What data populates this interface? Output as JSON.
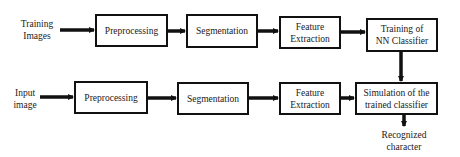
{
  "diagram": {
    "type": "flowchart",
    "colors": {
      "stroke": "#111111",
      "background": "#ffffff",
      "text": "#1a1a1a"
    },
    "training_row": {
      "input_label": "Training Images",
      "input_label_lines": [
        "Training",
        "Images"
      ],
      "steps": [
        {
          "id": "train-preprocessing",
          "lines": [
            "Preprocessing"
          ]
        },
        {
          "id": "train-segmentation",
          "lines": [
            "Segmentation"
          ]
        },
        {
          "id": "train-feature-extraction",
          "lines": [
            "Feature",
            "Extraction"
          ]
        },
        {
          "id": "train-nn-classifier",
          "lines": [
            "Training of",
            "NN Classifier"
          ]
        }
      ]
    },
    "testing_row": {
      "input_label": "Input image",
      "input_label_lines": [
        "Input",
        "image"
      ],
      "steps": [
        {
          "id": "test-preprocessing",
          "lines": [
            "Preprocessing"
          ]
        },
        {
          "id": "test-segmentation",
          "lines": [
            "Segmentation"
          ]
        },
        {
          "id": "test-feature-extraction",
          "lines": [
            "Feature",
            "Extraction"
          ]
        },
        {
          "id": "test-simulation",
          "lines": [
            "Simulation of the",
            "trained classifier"
          ]
        }
      ],
      "output_label": "Recognized character",
      "output_label_lines": [
        "Recognized",
        "character"
      ]
    },
    "edges": [
      {
        "from": "Training Images",
        "to": "Preprocessing (training)"
      },
      {
        "from": "Preprocessing (training)",
        "to": "Segmentation (training)"
      },
      {
        "from": "Segmentation (training)",
        "to": "Feature Extraction (training)"
      },
      {
        "from": "Feature Extraction (training)",
        "to": "Training of NN Classifier"
      },
      {
        "from": "Training of NN Classifier",
        "to": "Simulation of the trained classifier"
      },
      {
        "from": "Input image",
        "to": "Preprocessing (testing)"
      },
      {
        "from": "Preprocessing (testing)",
        "to": "Segmentation (testing)"
      },
      {
        "from": "Segmentation (testing)",
        "to": "Feature Extraction (testing)"
      },
      {
        "from": "Feature Extraction (testing)",
        "to": "Simulation of the trained classifier"
      },
      {
        "from": "Simulation of the trained classifier",
        "to": "Recognized character"
      }
    ]
  }
}
